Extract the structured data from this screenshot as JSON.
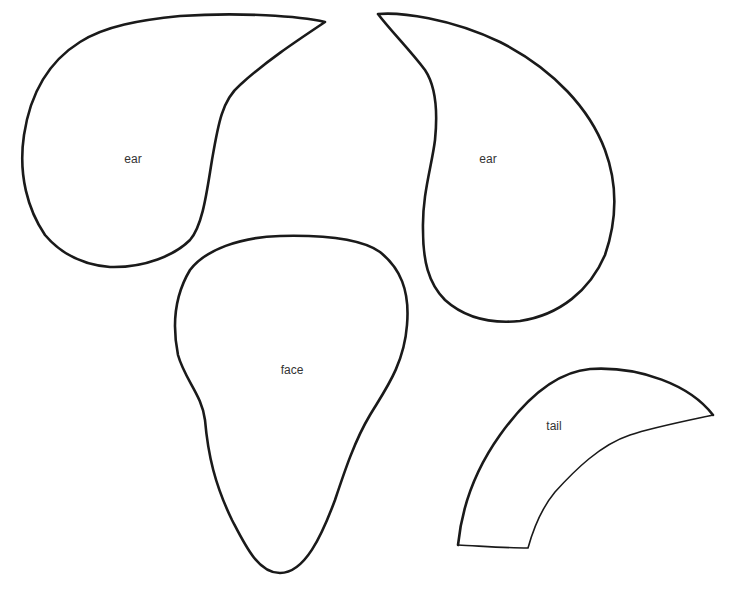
{
  "template": {
    "pieces": [
      {
        "id": "left-ear",
        "label": "ear"
      },
      {
        "id": "right-ear",
        "label": "ear"
      },
      {
        "id": "face",
        "label": "face"
      },
      {
        "id": "tail",
        "label": "tail"
      }
    ]
  },
  "colors": {
    "background": "#ffffff",
    "outline": "#1a1a1a",
    "label": "#333333"
  }
}
